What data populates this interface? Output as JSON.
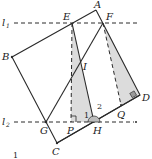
{
  "figure": {
    "caption_number": "1",
    "lines": [
      {
        "name": "l1",
        "label": "l",
        "subscript": "1"
      },
      {
        "name": "l2",
        "label": "l",
        "subscript": "2"
      }
    ],
    "points": {
      "A": "A",
      "B": "B",
      "C": "C",
      "D": "D",
      "E": "E",
      "F": "F",
      "G": "G",
      "H": "H",
      "I": "I",
      "P": "P",
      "Q": "Q"
    },
    "angles": {
      "angle1": "1",
      "angle2": "2"
    },
    "colors": {
      "stroke": "#2a2a2a",
      "shade": "#d9d9d9",
      "dash": "#2a2a2a"
    }
  }
}
